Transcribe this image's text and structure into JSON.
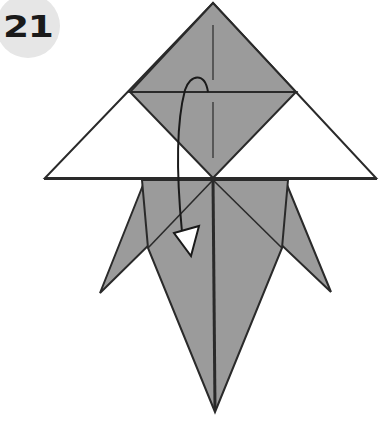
{
  "step": {
    "number": "21"
  },
  "colors": {
    "paper_colored": "#9b9b9b",
    "paper_white": "#ffffff",
    "line": "#2a2a2a",
    "badge": "#e6e6e6"
  },
  "diagram": {
    "icons": [
      "fold-arrow-icon"
    ]
  }
}
